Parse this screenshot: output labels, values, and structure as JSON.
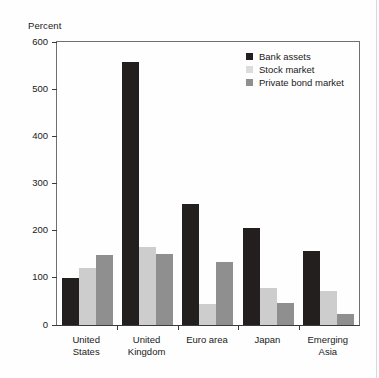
{
  "chart_data": {
    "type": "bar",
    "title": "",
    "subtitle": "",
    "xlabel": "",
    "ylabel": "Percent",
    "ylim": [
      0,
      600
    ],
    "yticks": [
      0,
      100,
      200,
      300,
      400,
      500,
      600
    ],
    "grid": false,
    "legend_position": "top-right",
    "categories": [
      "United States",
      "United Kingdom",
      "Euro area",
      "Japan",
      "Emerging Asia"
    ],
    "series": [
      {
        "name": "Bank assets",
        "color": "#231f1f",
        "values": [
          100,
          558,
          256,
          206,
          157
        ]
      },
      {
        "name": "Stock market",
        "color": "#cdcdcd",
        "values": [
          120,
          165,
          45,
          78,
          72
        ]
      },
      {
        "name": "Private bond market",
        "color": "#8f8f8f",
        "values": [
          148,
          150,
          134,
          47,
          23
        ]
      }
    ]
  },
  "axis": {
    "y_title": "Percent"
  },
  "legend": {
    "items": [
      {
        "label": "Bank assets"
      },
      {
        "label": "Stock market"
      },
      {
        "label": "Private bond market"
      }
    ]
  },
  "xaxis": {
    "labels": [
      {
        "line1": "United",
        "line2": "States"
      },
      {
        "line1": "United",
        "line2": "Kingdom"
      },
      {
        "line1": "Euro area",
        "line2": ""
      },
      {
        "line1": "Japan",
        "line2": ""
      },
      {
        "line1": "Emerging",
        "line2": "Asia"
      }
    ]
  },
  "yaxis": {
    "ticks": [
      "600",
      "500",
      "400",
      "300",
      "200",
      "100",
      "0"
    ]
  }
}
